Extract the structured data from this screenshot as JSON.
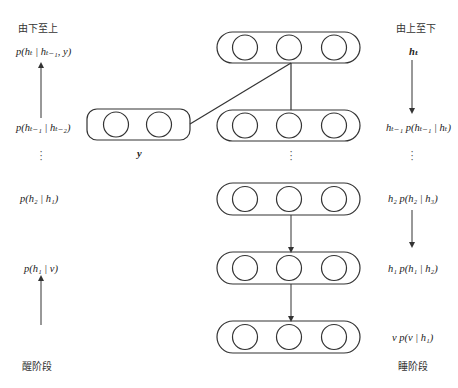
{
  "left_column": {
    "title": "由下至上",
    "phase_label": "醒阶段",
    "labels": [
      {
        "id": "top",
        "text": "p(hₜ | hₜ₋₁, y)"
      },
      {
        "id": "second",
        "text": "p(hₜ₋₁ | hₜ₋₂)"
      },
      {
        "id": "middle",
        "text": "p(h₂ | h₁)"
      },
      {
        "id": "bottom",
        "text": "p(h₁ | v)"
      }
    ],
    "ellipsis": "⋮",
    "arrow_direction": "up"
  },
  "right_column": {
    "title": "由上至下",
    "phase_label": "睡阶段",
    "labels": [
      {
        "id": "top",
        "text": "hₜ"
      },
      {
        "id": "second",
        "text": "hₜ₋₁  p(hₜ₋₁ | hₜ)"
      },
      {
        "id": "middle",
        "text": "h₂  p(h₂ | h₃)"
      },
      {
        "id": "lower",
        "text": "h₁  p(h₁ | h₂)"
      },
      {
        "id": "bottom",
        "text": "v  p(v | h₁)"
      }
    ],
    "ellipsis": "⋮",
    "arrow_direction": "down"
  },
  "network": {
    "label_input": "y",
    "layers": [
      {
        "id": "h_t",
        "units": 3
      },
      {
        "id": "h_t_minus_1",
        "units": 3
      },
      {
        "id": "h_2",
        "units": 3
      },
      {
        "id": "h_1",
        "units": 3
      },
      {
        "id": "v",
        "units": 3
      }
    ],
    "label_layer": {
      "id": "y",
      "units": 2
    },
    "ellipsis": "⋮"
  },
  "colors": {
    "stroke": "#333333",
    "background": "#ffffff",
    "text": "#222222"
  }
}
